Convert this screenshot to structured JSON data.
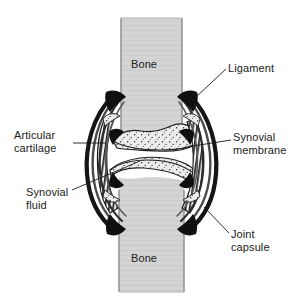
{
  "figure": {
    "width": 303,
    "height": 306,
    "background_color": "#ffffff"
  },
  "colors": {
    "bone_fill": "#d4d4d4",
    "bone_outline": "#6e6e6e",
    "cartilage_fill": "#e8e8e8",
    "cartilage_stipple": "#333333",
    "capsule_dark": "#151515",
    "ligament_band": "#3a3a3a",
    "synovial_membrane_hatch": "#2b2b2b",
    "joint_cavity_fill": "#ffffff",
    "label_text": "#1a1a1a",
    "leader_line": "#1a1a1a"
  },
  "labels": {
    "bone_upper": "Bone",
    "bone_lower": "Bone",
    "ligament": "Ligament",
    "synovial_membrane": "Synovial\nmembrane",
    "joint_capsule": "Joint\ncapsule",
    "articular_cartilage": "Articular\ncartilage",
    "synovial_fluid": "Synovial\nfluid"
  },
  "structures": [
    {
      "name": "bone-upper",
      "label": "Bone",
      "side": "top"
    },
    {
      "name": "bone-lower",
      "label": "Bone",
      "side": "bottom"
    },
    {
      "name": "articular-cartilage-upper",
      "label": "Articular cartilage"
    },
    {
      "name": "articular-cartilage-lower",
      "label": "Articular cartilage"
    },
    {
      "name": "joint-cavity",
      "label": "Synovial fluid"
    },
    {
      "name": "synovial-membrane",
      "label": "Synovial membrane"
    },
    {
      "name": "joint-capsule",
      "label": "Joint capsule"
    },
    {
      "name": "ligament",
      "label": "Ligament"
    }
  ],
  "leader_lines": [
    {
      "name": "leader-ligament",
      "from": [
        226,
        69
      ],
      "to": [
        196,
        97
      ]
    },
    {
      "name": "leader-synovial-membrane",
      "from": [
        231,
        140
      ],
      "to": [
        194,
        146
      ]
    },
    {
      "name": "leader-joint-capsule",
      "from": [
        229,
        233
      ],
      "to": [
        203,
        206
      ]
    },
    {
      "name": "leader-articular-cartilage",
      "from": [
        73,
        143
      ],
      "to": [
        106,
        143
      ]
    },
    {
      "name": "leader-synovial-fluid",
      "from": [
        72,
        190
      ],
      "to": [
        140,
        161
      ]
    }
  ]
}
